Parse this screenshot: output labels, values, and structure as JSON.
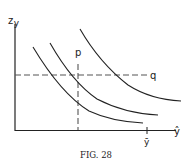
{
  "figure": {
    "caption": "FIG. 28",
    "axes": {
      "y_label_main": "z",
      "y_label_sub": "y",
      "x_label": "ŷ",
      "x_tick_label": "ȳ"
    },
    "guides": {
      "vertical_label": "p",
      "horizontal_label": "q"
    },
    "curves": [
      {
        "name": "indifference-curve-1"
      },
      {
        "name": "indifference-curve-2"
      },
      {
        "name": "indifference-curve-3"
      }
    ],
    "colors": {
      "ink": "#222222",
      "dash": "#555555",
      "background": "#ffffff"
    }
  }
}
